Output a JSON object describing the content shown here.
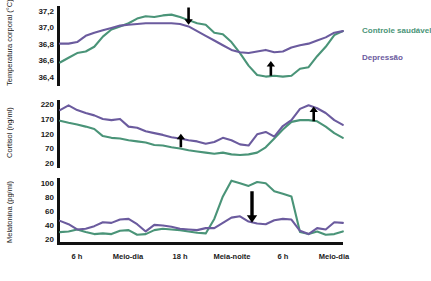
{
  "legend": {
    "items": [
      {
        "label": "Controle saudável",
        "color": "#4a9478",
        "key": "control"
      },
      {
        "label": "Depressão",
        "color": "#6b5b9e",
        "key": "depression"
      }
    ]
  },
  "xaxis": {
    "ticks": [
      {
        "label": "6 h",
        "x": 0
      },
      {
        "label": "Meio-dia",
        "x": 6
      },
      {
        "label": "18 h",
        "x": 12
      },
      {
        "label": "Meia-noite",
        "x": 18
      },
      {
        "label": "6 h",
        "x": 24
      },
      {
        "label": "Meio-dia",
        "x": 30
      }
    ],
    "range": [
      -2,
      33
    ]
  },
  "chart_data": [
    {
      "type": "line",
      "title": "",
      "panel": "temperature",
      "ylabel": "Temperatura corporal (°C)",
      "xlabel": "",
      "ylim": [
        36.3,
        37.32
      ],
      "yticks": [
        "37,2",
        "37,0",
        "36,8",
        "36,6",
        "36,4"
      ],
      "ytick_values": [
        37.2,
        37.0,
        36.8,
        36.6,
        36.4
      ],
      "grid": false,
      "x": [
        -2,
        -1,
        0,
        1,
        2,
        3,
        4,
        5,
        6,
        7,
        8,
        9,
        10,
        11,
        12,
        13,
        14,
        15,
        16,
        17,
        18,
        19,
        20,
        21,
        22,
        23,
        24,
        25,
        26,
        27,
        28,
        29,
        30,
        31
      ],
      "series": [
        {
          "name": "Controle saudável",
          "color": "#4a9478",
          "values": [
            36.6,
            36.66,
            36.72,
            36.74,
            36.8,
            36.93,
            37.02,
            37.06,
            37.1,
            37.16,
            37.19,
            37.18,
            37.2,
            37.21,
            37.18,
            37.14,
            37.1,
            37.08,
            36.98,
            36.96,
            36.86,
            36.72,
            36.56,
            36.44,
            36.42,
            36.43,
            36.42,
            36.43,
            36.52,
            36.54,
            36.68,
            36.8,
            36.95,
            37.0
          ]
        },
        {
          "name": "Depressão",
          "color": "#6b5b9e",
          "values": [
            36.84,
            36.84,
            36.86,
            36.94,
            36.98,
            37.01,
            37.04,
            37.07,
            37.08,
            37.09,
            37.1,
            37.1,
            37.1,
            37.1,
            37.09,
            37.06,
            37.0,
            36.94,
            36.88,
            36.82,
            36.76,
            36.73,
            36.72,
            36.74,
            36.76,
            36.73,
            36.74,
            36.79,
            36.82,
            36.84,
            36.88,
            36.92,
            36.98,
            37.0
          ]
        }
      ],
      "annotations": [
        {
          "type": "arrow-down",
          "x": 13.0,
          "y_top": 37.3,
          "y_tip": 37.08,
          "note": "temperatura máxima reduzida"
        },
        {
          "type": "arrow-up",
          "x": 22.6,
          "y_tip": 36.62,
          "y_bottom": 36.43,
          "note": "temperatura mínima elevada"
        }
      ]
    },
    {
      "type": "line",
      "title": "",
      "panel": "cortisol",
      "ylabel": "Cortisol (ng/ml)",
      "xlabel": "",
      "ylim": [
        10,
        240
      ],
      "yticks": [
        "220",
        "170",
        "120",
        "70",
        "20"
      ],
      "ytick_values": [
        220,
        170,
        120,
        70,
        20
      ],
      "grid": false,
      "x": [
        -2,
        -1,
        0,
        1,
        2,
        3,
        4,
        5,
        6,
        7,
        8,
        9,
        10,
        11,
        12,
        13,
        14,
        15,
        16,
        17,
        18,
        19,
        20,
        21,
        22,
        23,
        24,
        25,
        26,
        27,
        28,
        29,
        30,
        31
      ],
      "series": [
        {
          "name": "Controle saudável",
          "color": "#4a9478",
          "values": [
            170,
            163,
            157,
            150,
            142,
            118,
            112,
            110,
            104,
            100,
            96,
            88,
            86,
            80,
            76,
            70,
            66,
            62,
            58,
            62,
            56,
            54,
            56,
            62,
            80,
            110,
            140,
            166,
            172,
            172,
            168,
            150,
            128,
            112
          ]
        },
        {
          "name": "Depressão",
          "color": "#6b5b9e",
          "values": [
            206,
            222,
            206,
            196,
            188,
            176,
            172,
            176,
            150,
            146,
            134,
            128,
            122,
            114,
            110,
            104,
            100,
            92,
            98,
            112,
            104,
            90,
            86,
            124,
            132,
            116,
            152,
            172,
            210,
            222,
            212,
            196,
            172,
            156
          ]
        }
      ],
      "annotations": [
        {
          "type": "arrow-up",
          "x": 12.1,
          "y_tip": 126,
          "y_bottom": 80,
          "note": "cortisol diurno elevado"
        },
        {
          "type": "arrow-up",
          "x": 27.6,
          "y_tip": 218,
          "y_bottom": 168,
          "note": "pico matinal de cortisol elevado"
        }
      ]
    },
    {
      "type": "line",
      "title": "",
      "panel": "melatonin",
      "ylabel": "Melatonina (pg/ml)",
      "xlabel": "",
      "ylim": [
        15,
        112
      ],
      "yticks": [
        "100",
        "80",
        "60",
        "40",
        "20"
      ],
      "ytick_values": [
        100,
        80,
        60,
        40,
        20
      ],
      "grid": false,
      "x": [
        -2,
        -1,
        0,
        1,
        2,
        3,
        4,
        5,
        6,
        7,
        8,
        9,
        10,
        11,
        12,
        13,
        14,
        15,
        16,
        17,
        18,
        19,
        20,
        21,
        22,
        23,
        24,
        25,
        26,
        27,
        28,
        29,
        30,
        31
      ],
      "series": [
        {
          "name": "Controle saudável",
          "color": "#4a9478",
          "values": [
            30,
            31,
            34,
            30,
            27,
            28,
            27,
            32,
            33,
            26,
            27,
            33,
            35,
            34,
            33,
            31,
            29,
            28,
            50,
            84,
            108,
            104,
            100,
            106,
            104,
            92,
            88,
            84,
            30,
            27,
            31,
            26,
            27,
            31
          ]
        },
        {
          "name": "Depressão",
          "color": "#6b5b9e",
          "values": [
            47,
            42,
            34,
            35,
            39,
            45,
            44,
            49,
            50,
            42,
            31,
            41,
            40,
            38,
            35,
            34,
            33,
            36,
            36,
            44,
            52,
            54,
            46,
            43,
            42,
            48,
            50,
            49,
            32,
            27,
            36,
            34,
            45,
            44
          ]
        }
      ],
      "annotations": [
        {
          "type": "arrow-down",
          "x": 20.4,
          "y_top": 92,
          "y_tip": 44,
          "note": "melatonina noturna reduzida",
          "size": "large"
        }
      ]
    }
  ]
}
